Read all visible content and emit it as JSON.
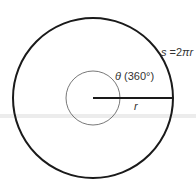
{
  "diagram": {
    "arc_length_label": {
      "var": "s",
      "eq": " =2",
      "pi": "π",
      "r": "r"
    },
    "angle_label": {
      "theta": "θ",
      "value": " (360°)"
    },
    "radius_label": "r",
    "colors": {
      "outer_circle": "#1a1a1a",
      "inner_circle": "#555555",
      "radius": "#1a1a1a",
      "band": "#ececec"
    }
  }
}
